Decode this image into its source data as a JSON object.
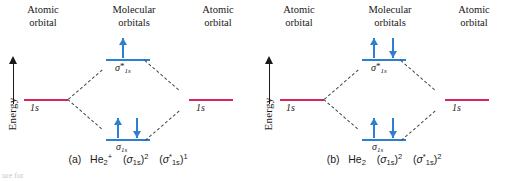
{
  "figure": {
    "type": "molecular-orbital-energy-diagram",
    "panel_count": 2,
    "colors": {
      "atomic_orbital_line": "#d6245f",
      "molecular_orbital_line": "#2e7fd0",
      "electron_arrow": "#2e7fd0",
      "correlation_line": "#444444",
      "text": "#1a1a1a",
      "background": "#ffffff"
    }
  },
  "headers": {
    "left": "Atomic\norbital",
    "middle": "Molecular\norbitals",
    "right": "Atomic\norbital"
  },
  "axis": {
    "label": "Energy",
    "direction": "up",
    "arrow_icon": "up-arrow-icon"
  },
  "panel_a": {
    "id": "a",
    "species": "He2+",
    "caption_prefix": "(a)",
    "caption_species_main": "He",
    "caption_species_sub": "2",
    "caption_species_sup": "+",
    "config_bonding_orbital": "σ",
    "config_bonding_sub": "1s",
    "config_bonding_sup": "2",
    "config_antibonding_orbital": "σ",
    "config_antibonding_star": "*",
    "config_antibonding_sub": "1s",
    "config_antibonding_sup": "1",
    "left_ao_label": "1s",
    "right_ao_label": "1s",
    "bonding_label": "σ",
    "bonding_sub": "1s",
    "antibonding_label": "σ",
    "antibonding_star": "*",
    "antibonding_sub": "1s",
    "electrons_bonding": 2,
    "electrons_antibonding": 1,
    "electrons_left_ao": 0,
    "electrons_right_ao": 0,
    "bonding_spins": [
      "up",
      "down"
    ],
    "antibonding_spins": [
      "up"
    ],
    "total_electrons": 3
  },
  "panel_b": {
    "id": "b",
    "species": "He2",
    "caption_prefix": "(b)",
    "caption_species_main": "He",
    "caption_species_sub": "2",
    "caption_species_sup": "",
    "config_bonding_orbital": "σ",
    "config_bonding_sub": "1s",
    "config_bonding_sup": "2",
    "config_antibonding_orbital": "σ",
    "config_antibonding_star": "*",
    "config_antibonding_sub": "1s",
    "config_antibonding_sup": "2",
    "left_ao_label": "1s",
    "right_ao_label": "1s",
    "bonding_label": "σ",
    "bonding_sub": "1s",
    "antibonding_label": "σ",
    "antibonding_star": "*",
    "antibonding_sub": "1s",
    "electrons_bonding": 2,
    "electrons_antibonding": 2,
    "electrons_left_ao": 0,
    "electrons_right_ao": 0,
    "bonding_spins": [
      "up",
      "down"
    ],
    "antibonding_spins": [
      "up",
      "down"
    ],
    "total_electrons": 4
  },
  "footer_fragment": "ure for"
}
